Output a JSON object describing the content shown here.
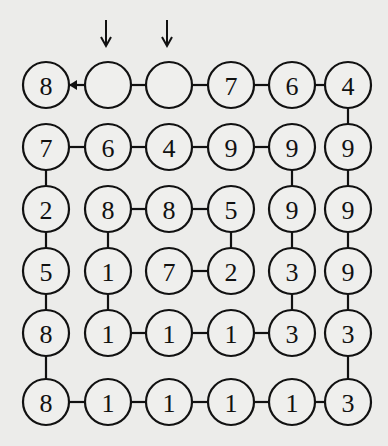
{
  "puzzle": {
    "rows": 6,
    "cols": 6,
    "row_y": [
      85,
      147,
      209,
      271,
      333,
      402
    ],
    "col_x": [
      46,
      108,
      169,
      231,
      292,
      348
    ],
    "radius": 23,
    "grid": [
      [
        "8",
        "",
        "",
        "7",
        "6",
        "4"
      ],
      [
        "7",
        "6",
        "4",
        "9",
        "9",
        "9"
      ],
      [
        "2",
        "8",
        "8",
        "5",
        "9",
        "9"
      ],
      [
        "5",
        "1",
        "7",
        "2",
        "3",
        "9"
      ],
      [
        "8",
        "1",
        "1",
        "1",
        "3",
        "3"
      ],
      [
        "8",
        "1",
        "1",
        "1",
        "1",
        "3"
      ]
    ],
    "horizontal_links": [
      [
        [
          0,
          1
        ],
        [
          1,
          2
        ],
        [
          2,
          3
        ],
        [
          3,
          4
        ],
        [
          4,
          5
        ]
      ],
      [
        [
          0,
          1
        ],
        [
          1,
          2
        ],
        [
          2,
          3
        ],
        [
          3,
          4
        ]
      ],
      [
        [
          1,
          2
        ],
        [
          2,
          3
        ]
      ],
      [
        [
          2,
          3
        ]
      ],
      [
        [
          1,
          2
        ],
        [
          2,
          3
        ],
        [
          3,
          4
        ]
      ],
      [
        [
          0,
          1
        ],
        [
          1,
          2
        ],
        [
          2,
          3
        ],
        [
          3,
          4
        ],
        [
          4,
          5
        ]
      ]
    ],
    "vertical_links": [
      [
        5
      ],
      [
        0,
        4,
        5
      ],
      [
        0,
        1,
        3,
        4,
        5
      ],
      [
        0,
        1,
        4,
        5
      ],
      [
        0,
        5
      ]
    ],
    "start_arrow": {
      "from": [
        0,
        1
      ],
      "to": [
        0,
        0
      ],
      "icon": "left-arrowhead-icon"
    },
    "down_arrows": [
      {
        "col": 1,
        "icon": "down-arrow-icon"
      },
      {
        "col": 2,
        "icon": "down-arrow-icon"
      }
    ],
    "colors": {
      "ink": "#111111",
      "paper": "#ececea"
    }
  }
}
